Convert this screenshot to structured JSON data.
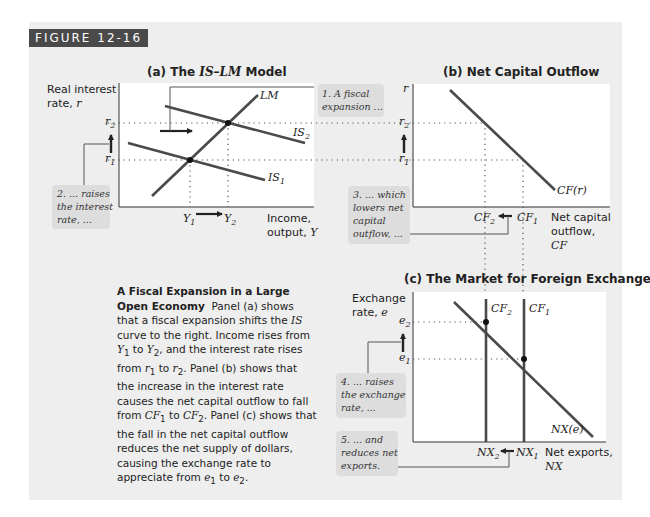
{
  "figure": {
    "tag": "FIGURE 12-16",
    "colors": {
      "background": "#eeeeee",
      "tag_bg": "#4a4a4a",
      "plot_bg": "#ffffff",
      "curve": "#4a4a4a",
      "callout": "#dddddd"
    }
  },
  "panel_a": {
    "title_prefix": "(a) The ",
    "title_em": "IS–LM",
    "title_suffix": " Model",
    "y_label_1": "Real interest",
    "y_label_2": "rate, ",
    "y_label_var": "r",
    "x_label_1": "Income,",
    "x_label_2": "output, ",
    "x_label_var": "Y",
    "curves": {
      "lm": "LM",
      "is2": "IS",
      "is2_sub": "2",
      "is1": "IS",
      "is1_sub": "1"
    },
    "ticks": {
      "r2": "r",
      "r2_sub": "2",
      "r1": "r",
      "r1_sub": "1",
      "y1": "Y",
      "y1_sub": "1",
      "y2": "Y",
      "y2_sub": "2"
    },
    "note_1": [
      "1. A fiscal",
      "expansion ..."
    ],
    "note_2": [
      "2. ... raises",
      "the interest",
      "rate, ..."
    ]
  },
  "panel_b": {
    "title": "(b) Net Capital Outflow",
    "y_label": "r",
    "x_label_1": "Net capital",
    "x_label_2": "outflow,",
    "x_label_3": "CF",
    "curve": "CF(r)",
    "ticks": {
      "r2": "r",
      "r2_sub": "2",
      "r1": "r",
      "r1_sub": "1",
      "cf2": "CF",
      "cf2_sub": "2",
      "cf1": "CF",
      "cf1_sub": "1"
    },
    "note_3": [
      "3. ... which",
      "lowers net",
      "capital",
      "outflow, ..."
    ]
  },
  "panel_c": {
    "title": "(c) The Market for Foreign Exchange",
    "y_label_1": "Exchange",
    "y_label_2": "rate, ",
    "y_label_var": "e",
    "x_label_1": "Net exports,",
    "x_label_2": "NX",
    "curve": "NX(e)",
    "supply": {
      "cf2": "CF",
      "cf2_sub": "2",
      "cf1": "CF",
      "cf1_sub": "1"
    },
    "ticks": {
      "e2": "e",
      "e2_sub": "2",
      "e1": "e",
      "e1_sub": "1",
      "nx2": "NX",
      "nx2_sub": "2",
      "nx1": "NX",
      "nx1_sub": "1"
    },
    "note_4": [
      "4. ... raises",
      "the exchange",
      "rate, ..."
    ],
    "note_5": [
      "5. ... and",
      "reduces net",
      "exports."
    ]
  },
  "caption": {
    "heading": "A Fiscal Expansion in a Large Open Economy",
    "body": "Panel (a) shows that a fiscal expansion shifts the IS curve to the right. Income rises from Y1 to Y2, and the interest rate rises from r1 to r2. Panel (b) shows that the increase in the interest rate causes the net capital outflow to fall from CF1 to CF2. Panel (c) shows that the fall in the net capital outflow reduces the net supply of dollars, causing the exchange rate to appreciate from e1 to e2.",
    "parts": {
      "p1": "Panel (a) shows that a fiscal expansion shifts the ",
      "is": "IS",
      "p2": " curve to the right. Income rises from ",
      "y1": "Y",
      "p3": " to ",
      "y2": "Y",
      "p4": ", and the interest rate rises from ",
      "r1": "r",
      "p5": " to ",
      "r2": "r",
      "p6": ". Panel (b) shows that the increase in the interest rate causes the net capital outflow to fall from ",
      "cf1": "CF",
      "p7": " to ",
      "cf2": "CF",
      "p8": ". Panel (c) shows that the fall in the net capital outflow reduces the net supply of dollars, causing the exchange rate to appreciate from ",
      "e1": "e",
      "p9": " to ",
      "e2": "e",
      "p10": ".",
      "sub1": "1",
      "sub2": "2"
    }
  }
}
